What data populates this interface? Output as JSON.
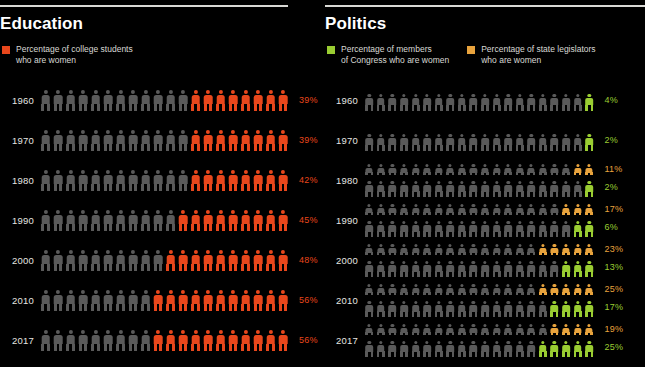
{
  "colors": {
    "background": "#000000",
    "rule": "#d8d8d4",
    "title": "#ffffff",
    "legend_text": "#d9d9d5",
    "inactive_figure": "#5a5a5a",
    "education_accent": "#e8471c",
    "congress_accent": "#9acd32",
    "legislator_accent": "#e8a33d"
  },
  "panels": [
    {
      "id": "education",
      "title": "Education",
      "legend": [
        {
          "swatch_color": "#e8471c",
          "label": "Percentage of college students\nwho are women"
        }
      ]
    },
    {
      "id": "politics",
      "title": "Politics",
      "legend": [
        {
          "swatch_color": "#9acd32",
          "label": "Percentage of members\nof Congress who are women"
        },
        {
          "swatch_color": "#e8a33d",
          "label": "Percentage of state legislators\nwho are women"
        }
      ]
    }
  ],
  "chart_data": [
    {
      "type": "bar",
      "id": "education-pictogram",
      "title": "Education",
      "subtitle": "Percentage of college students who are women",
      "xlabel": "",
      "ylabel": "",
      "legend_position": "top-left",
      "grid": false,
      "icon_total": 20,
      "unit": "percent",
      "categories": [
        "1960",
        "1970",
        "1980",
        "1990",
        "2000",
        "2010",
        "2017"
      ],
      "series": [
        {
          "name": "Percentage of college students who are women",
          "color": "#e8471c",
          "values": [
            39,
            39,
            42,
            45,
            48,
            56,
            56
          ],
          "labels": [
            "39%",
            "39%",
            "42%",
            "45%",
            "48%",
            "56%",
            "56%"
          ],
          "filled_icons": [
            8,
            8,
            8,
            9,
            10,
            11,
            11
          ]
        }
      ]
    },
    {
      "type": "bar",
      "id": "politics-pictogram",
      "title": "Politics",
      "subtitle": "Percentage of members of Congress and state legislators who are women",
      "xlabel": "",
      "ylabel": "",
      "legend_position": "top-left",
      "grid": false,
      "icon_total": 20,
      "unit": "percent",
      "categories": [
        "1960",
        "1970",
        "1980",
        "1990",
        "2000",
        "2010",
        "2017"
      ],
      "series": [
        {
          "name": "Percentage of state legislators who are women",
          "color": "#e8a33d",
          "values": [
            null,
            null,
            11,
            17,
            23,
            25,
            19
          ],
          "labels": [
            "",
            "",
            "11%",
            "17%",
            "23%",
            "25%",
            "19%"
          ],
          "filled_icons": [
            0,
            0,
            2,
            3,
            5,
            5,
            4
          ]
        },
        {
          "name": "Percentage of members of Congress who are women",
          "color": "#9acd32",
          "values": [
            4,
            2,
            2,
            6,
            13,
            17,
            25
          ],
          "labels": [
            "4%",
            "2%",
            "2%",
            "6%",
            "13%",
            "17%",
            "25%"
          ],
          "filled_icons": [
            1,
            1,
            1,
            2,
            3,
            4,
            5
          ]
        }
      ]
    }
  ]
}
